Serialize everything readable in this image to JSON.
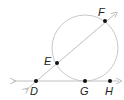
{
  "diagram": {
    "type": "geometry-circle-secant-tangent",
    "colors": {
      "circle": "#c8c8c8",
      "line": "#c0c0c0",
      "point": "#111111",
      "label": "#222222"
    },
    "circle": {
      "cx": 85,
      "cy": 48,
      "r": 33
    },
    "points": [
      {
        "id": "D",
        "label": "D",
        "x": 36,
        "y": 81,
        "lx": 30,
        "ly": 95
      },
      {
        "id": "E",
        "label": "E",
        "x": 57,
        "y": 63,
        "lx": 44,
        "ly": 65
      },
      {
        "id": "F",
        "label": "F",
        "x": 105,
        "y": 21,
        "lx": 98,
        "ly": 16
      },
      {
        "id": "G",
        "label": "G",
        "x": 85,
        "y": 81,
        "lx": 80,
        "ly": 95
      },
      {
        "id": "H",
        "label": "H",
        "x": 110,
        "y": 81,
        "lx": 105,
        "ly": 95
      }
    ],
    "lines": [
      {
        "id": "tangent-DH",
        "description": "line through D, G, H tangent to circle at G",
        "x1": 13,
        "y1": 81,
        "x2": 119,
        "y2": 81
      },
      {
        "id": "secant-DF",
        "description": "secant line through D, E, F",
        "x1": 26,
        "y1": 90,
        "x2": 115,
        "y2": 14
      }
    ]
  }
}
